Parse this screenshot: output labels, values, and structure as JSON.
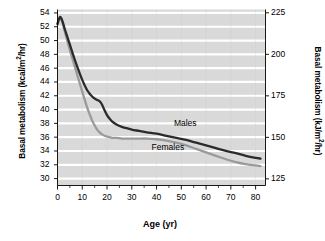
{
  "chart_data": {
    "type": "line",
    "title": "",
    "xlabel": "Age (yr)",
    "ylabel": "Basal metabolism (kcal/m2/hr)",
    "ylabel_right": "Basal metabolism (kJ/m2/hr)",
    "xlim": [
      0,
      84
    ],
    "ylim": [
      29,
      54.5
    ],
    "ylim_right": [
      121,
      227
    ],
    "xticks": [
      0,
      10,
      20,
      30,
      40,
      50,
      60,
      70,
      80
    ],
    "xticklabels": [
      "0",
      "10",
      "20",
      "30",
      "40",
      "50",
      "60",
      "70",
      "80"
    ],
    "xminorticks": [
      5,
      15,
      25,
      35,
      45,
      55,
      65,
      75
    ],
    "yticks": [
      30,
      32,
      34,
      36,
      38,
      40,
      42,
      44,
      46,
      48,
      50,
      52,
      54
    ],
    "yticklabels": [
      "30",
      "32",
      "34",
      "36",
      "38",
      "40",
      "42",
      "44",
      "46",
      "48",
      "50",
      "52",
      "54"
    ],
    "yticks_right": [
      125,
      150,
      175,
      200,
      225
    ],
    "yticklabels_right": [
      "125",
      "150",
      "175",
      "200",
      "225"
    ],
    "grid": true,
    "grid_color": "#ffffff",
    "plot_bg": "#d9d9d9",
    "legend_position": "inline-annotation",
    "series": [
      {
        "name": "Males",
        "color": "#2b2b2b",
        "label_x": 47,
        "label_y": 37.9,
        "x": [
          0,
          1,
          2,
          3,
          4,
          5,
          6,
          7,
          8,
          9,
          10,
          11,
          12,
          13,
          14,
          15,
          16,
          17,
          18,
          19,
          20,
          21,
          22,
          24,
          26,
          28,
          30,
          33,
          36,
          40,
          44,
          48,
          52,
          56,
          60,
          64,
          68,
          72,
          76,
          80,
          82
        ],
        "y": [
          52.4,
          53.4,
          52.8,
          51.6,
          50.5,
          49.4,
          48.3,
          47.2,
          46.2,
          45.2,
          44.3,
          43.5,
          42.8,
          42.3,
          41.9,
          41.6,
          41.4,
          41.2,
          40.7,
          39.9,
          39.2,
          38.7,
          38.3,
          37.8,
          37.5,
          37.3,
          37.1,
          36.9,
          36.7,
          36.5,
          36.2,
          35.9,
          35.6,
          35.2,
          34.8,
          34.4,
          34.0,
          33.7,
          33.3,
          33.0,
          32.9
        ]
      },
      {
        "name": "Females",
        "color": "#9a9a9a",
        "label_x": 38,
        "label_y": 34.4,
        "x": [
          0,
          1,
          2,
          3,
          4,
          5,
          6,
          7,
          8,
          9,
          10,
          11,
          12,
          13,
          14,
          15,
          16,
          17,
          18,
          19,
          20,
          21,
          22,
          24,
          26,
          28,
          30,
          33,
          36,
          40,
          44,
          48,
          52,
          56,
          60,
          64,
          68,
          72,
          76,
          80,
          82
        ],
        "y": [
          52.4,
          53.4,
          52.6,
          51.2,
          49.9,
          48.6,
          47.4,
          46.2,
          45.0,
          43.8,
          42.6,
          41.4,
          40.3,
          39.3,
          38.4,
          37.7,
          37.1,
          36.7,
          36.4,
          36.2,
          36.1,
          36.0,
          35.9,
          35.9,
          35.8,
          35.8,
          35.8,
          35.8,
          35.8,
          35.7,
          35.5,
          35.2,
          34.8,
          34.3,
          33.8,
          33.3,
          32.8,
          32.4,
          32.1,
          31.9,
          31.8
        ]
      }
    ]
  },
  "axes": {
    "ylabel_left_prefix": "Basal metabolism (kcal/m",
    "ylabel_left_sup": "2",
    "ylabel_left_suffix": "/hr)",
    "ylabel_right_prefix": "Basal metabolism (kJ/m",
    "ylabel_right_sup": "2",
    "ylabel_right_suffix": "/hr)",
    "xaxis_title": "Age (yr)"
  }
}
